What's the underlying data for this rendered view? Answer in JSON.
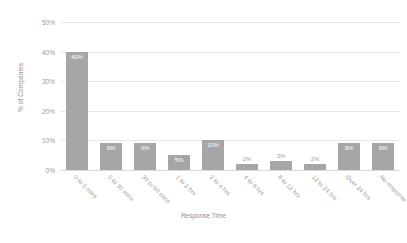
{
  "chart_data": {
    "type": "bar",
    "title": "",
    "xlabel": "Response Time",
    "ylabel": "% of Companies",
    "categories": [
      "0 to 5 mins",
      "5 to 30 mins",
      "30 to 60 mins",
      "1 to 2 hrs",
      "2 to 4 hrs",
      "4 to 8 hrs",
      "8 to 12 hrs",
      "12 to 24 hrs",
      "Over 24 hrs",
      "No response"
    ],
    "values": [
      40,
      9,
      9,
      5,
      10,
      2,
      3,
      2,
      9,
      9
    ],
    "data_labels": [
      "40%",
      "9%",
      "9%",
      "5%",
      "10%",
      "2%",
      "3%",
      "2%",
      "9%",
      "9%"
    ],
    "ylim": [
      0,
      50
    ],
    "yticks": [
      0,
      10,
      20,
      30,
      40,
      50
    ],
    "ytick_labels": [
      "0%",
      "10%",
      "20%",
      "30%",
      "40%",
      "50%"
    ],
    "grid": true,
    "legend": false,
    "bar_color": "#a6a6a6",
    "gridline_color": "#e8e8e8",
    "text_color": "#9a9a9a",
    "background_color": "#ffffff"
  }
}
